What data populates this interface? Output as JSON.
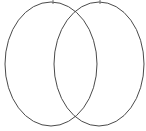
{
  "canvas": {
    "width": 146,
    "height": 131,
    "background_color": "#ffffff",
    "title": "",
    "description": "Two overlapping ellipse outlines"
  },
  "style": {
    "stroke_color": "#4a4a4a",
    "stroke_width": 1,
    "fill": "none",
    "tick_color": "#6e6e6e",
    "tick_width": 1
  },
  "chart_data": {
    "type": "scatter",
    "title": "",
    "xlabel": "",
    "ylabel": "",
    "grid": false,
    "legend": null,
    "xlim": [
      0,
      146
    ],
    "ylim": [
      0,
      131
    ],
    "shapes": [
      {
        "name": "left-ellipse",
        "kind": "ellipse",
        "cx": 51,
        "cy": 64,
        "rx": 46,
        "ry": 62,
        "fill": "none",
        "stroke": "#4a4a4a"
      },
      {
        "name": "right-ellipse",
        "kind": "ellipse",
        "cx": 99,
        "cy": 64,
        "rx": 45,
        "ry": 62,
        "fill": "none",
        "stroke": "#4a4a4a"
      }
    ],
    "ticks": [
      {
        "name": "left-ellipse-apex-tick",
        "x": 53,
        "y1": 0,
        "y2": 4
      },
      {
        "name": "right-ellipse-apex-tick",
        "x": 100,
        "y1": 0,
        "y2": 4
      }
    ],
    "intersections": [
      {
        "name": "top-intersection",
        "x": 77,
        "y": 10
      },
      {
        "name": "bottom-intersection",
        "x": 77,
        "y": 116
      }
    ]
  }
}
